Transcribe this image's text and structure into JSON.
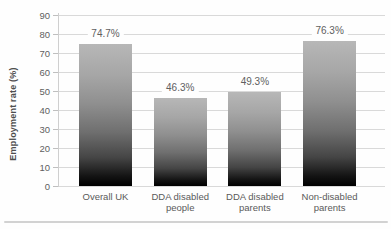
{
  "chart_data": {
    "type": "bar",
    "categories": [
      "Overall UK",
      "DDA disabled people",
      "DDA disabled parents",
      "Non-disabled parents"
    ],
    "values": [
      74.7,
      46.3,
      49.3,
      76.3
    ],
    "value_labels": [
      "74.7%",
      "46.3%",
      "49.3%",
      "76.3%"
    ],
    "title": "",
    "xlabel": "",
    "ylabel": "Employment rate (%)",
    "ylim": [
      0,
      90
    ],
    "yticks": [
      0,
      10,
      20,
      30,
      40,
      50,
      60,
      70,
      80,
      90
    ],
    "grid": true,
    "legend": false,
    "bar_color_top": "#b7b7b7",
    "bar_color_bottom": "#000000",
    "gridline_color": "#d9d9d9",
    "text_color": "#5a5a5a"
  }
}
